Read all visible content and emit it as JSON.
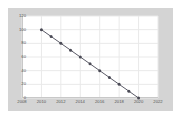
{
  "chart_data": {
    "type": "line",
    "title": "",
    "subtitle": "",
    "xlabel": "",
    "ylabel": "",
    "x": [
      2010,
      2011,
      2012,
      2013,
      2014,
      2015,
      2016,
      2017,
      2018,
      2019,
      2020
    ],
    "values": [
      100,
      90,
      80,
      70,
      60,
      50,
      40,
      30,
      20,
      10,
      0
    ],
    "series": [
      {
        "name": "series-1",
        "values": [
          100,
          90,
          80,
          70,
          60,
          50,
          40,
          30,
          20,
          10,
          0
        ]
      }
    ],
    "xlim": [
      2008,
      2022
    ],
    "ylim": [
      0,
      120
    ],
    "x_ticks": [
      2008,
      2010,
      2012,
      2014,
      2016,
      2018,
      2020,
      2022
    ],
    "x_tick_labels": [
      "2008",
      "2010",
      "2012",
      "2014",
      "2016",
      "2018",
      "2020",
      "2022"
    ],
    "y_ticks": [
      0,
      20,
      40,
      60,
      80,
      100,
      120
    ],
    "y_tick_labels": [
      "0",
      "20",
      "40",
      "60",
      "80",
      "100",
      "120"
    ],
    "grid": true,
    "legend": false,
    "legend_position": "none",
    "marker": "circle",
    "colors": {
      "line": "#5a5a66",
      "marker": "#4a4a55",
      "grid": "#e9e9e9",
      "plot_background": "#ffffff",
      "figure_background": "#d4d4d4",
      "page_background": "#ffffff",
      "tick_label": "#555555",
      "axis": "#c8c8c8"
    }
  }
}
